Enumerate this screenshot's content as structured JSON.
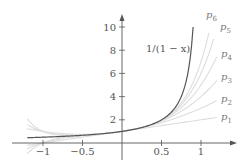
{
  "chart_data": {
    "type": "line",
    "title": "",
    "xlabel": "",
    "ylabel": "",
    "xlim": [
      -1.2,
      1.45
    ],
    "ylim": [
      -1.5,
      11.5
    ],
    "grid": false,
    "legend": "inline labels at right end of curves",
    "x_ticks": [
      {
        "value": -1,
        "label": "−1"
      },
      {
        "value": -0.5,
        "label": "−0.5"
      },
      {
        "value": 0.5,
        "label": "0.5"
      },
      {
        "value": 1,
        "label": "1"
      }
    ],
    "y_ticks": [
      {
        "value": 2,
        "label": "2"
      },
      {
        "value": 4,
        "label": "4"
      },
      {
        "value": 6,
        "label": "6"
      },
      {
        "value": 8,
        "label": "8"
      },
      {
        "value": 10,
        "label": "10"
      }
    ],
    "series": [
      {
        "name": "1/(1 − x)",
        "kind": "function",
        "formula": "1/(1-x)",
        "x_range": [
          -1.2,
          0.9
        ],
        "color": "#555555",
        "width": 1.2
      },
      {
        "name": "p1",
        "sub": "1",
        "degree": 1,
        "x_range": [
          -1.2,
          1.2
        ],
        "color": "#dddddd"
      },
      {
        "name": "p2",
        "sub": "2",
        "degree": 2,
        "x_range": [
          -1.2,
          1.2
        ],
        "color": "#dddddd"
      },
      {
        "name": "p3",
        "sub": "3",
        "degree": 3,
        "x_range": [
          -1.2,
          1.2
        ],
        "color": "#dddddd"
      },
      {
        "name": "p4",
        "sub": "4",
        "degree": 4,
        "x_range": [
          -1.2,
          1.2
        ],
        "color": "#dddddd"
      },
      {
        "name": "p5",
        "sub": "5",
        "degree": 5,
        "x_range": [
          -1.2,
          1.16
        ],
        "color": "#dddddd"
      },
      {
        "name": "p6",
        "sub": "6",
        "degree": 6,
        "x_range": [
          -1.2,
          1.1
        ],
        "color": "#dddddd"
      }
    ],
    "annotations": [
      {
        "text": "1/(1 − x)",
        "x_px": 146,
        "y_px": 52
      },
      {
        "text": "p",
        "sub": "1",
        "x_px": 221,
        "y_px": 120
      },
      {
        "text": "p",
        "sub": "2",
        "x_px": 221,
        "y_px": 102
      },
      {
        "text": "p",
        "sub": "3",
        "x_px": 221,
        "y_px": 80
      },
      {
        "text": "p",
        "sub": "4",
        "x_px": 221,
        "y_px": 57
      },
      {
        "text": "p",
        "sub": "5",
        "x_px": 220,
        "y_px": 30
      },
      {
        "text": "p",
        "sub": "6",
        "x_px": 206,
        "y_px": 18
      }
    ]
  },
  "axes": {
    "origin_px": [
      122,
      143
    ],
    "x_unit_px": 79,
    "y_unit_px": 11.6,
    "x_axis_end_px": 237,
    "y_axis_end_px": 14,
    "axis_color": "#555555"
  },
  "labels": {
    "main_function": "1/(1 − x)"
  }
}
